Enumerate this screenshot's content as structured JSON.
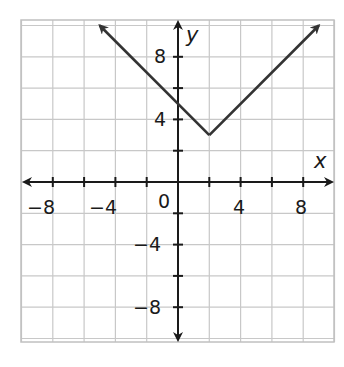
{
  "chart_data": {
    "type": "line",
    "title": "",
    "xlabel": "x",
    "ylabel": "y",
    "xlim": [
      -10,
      10
    ],
    "ylim": [
      -10.2,
      10.3
    ],
    "grid": true,
    "grid_step": 2,
    "x_ticks": [
      -8,
      -4,
      4,
      8
    ],
    "y_ticks": [
      8,
      4,
      -4,
      -8
    ],
    "origin_label": "0",
    "series": [
      {
        "name": "y = |x - 2| + 3",
        "x": [
          -5,
          2,
          9
        ],
        "y": [
          10,
          3,
          10
        ],
        "arrows": "both ends",
        "color": "#333333"
      }
    ],
    "vertex": [
      2,
      3
    ],
    "y_intercept": 5
  },
  "labels": {
    "x_axis": "x",
    "y_axis": "y",
    "origin": "0",
    "x_ticks": [
      "−8",
      "−4",
      "4",
      "8"
    ],
    "y_ticks": [
      "8",
      "4",
      "−4",
      "−8"
    ]
  },
  "colors": {
    "grid": "#c8c8c8",
    "axis": "#1a1a1a",
    "line": "#333333"
  }
}
